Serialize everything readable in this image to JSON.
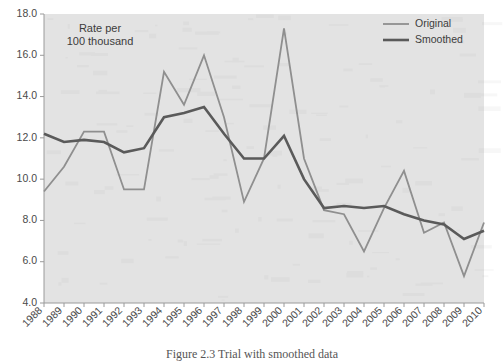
{
  "chart_data": {
    "type": "line",
    "title": "",
    "annotation": "Rate per\n100 thousand",
    "annotation_line1": "Rate per",
    "annotation_line2": "100 thousand",
    "xlabel": "",
    "ylabel": "",
    "ylim": [
      4.0,
      18.0
    ],
    "ytick_step": 2.0,
    "ytick_labels": [
      "18.0",
      "16.0",
      "14.0",
      "12.0",
      "10.0",
      "8.0",
      "6.0",
      "4.0"
    ],
    "ytick_values": [
      18.0,
      16.0,
      14.0,
      12.0,
      10.0,
      8.0,
      6.0,
      4.0
    ],
    "grid": false,
    "legend_position": "top-right",
    "categories": [
      "1988",
      "1989",
      "1990",
      "1991",
      "1992",
      "1993",
      "1994",
      "1995",
      "1996",
      "1997",
      "1998",
      "1999",
      "2000",
      "2001",
      "2002",
      "2003",
      "2004",
      "2005",
      "2006",
      "2007",
      "2008",
      "2009",
      "2010"
    ],
    "series": [
      {
        "name": "Original",
        "color": "#8f8f8f",
        "width": 1.8,
        "values": [
          9.4,
          10.6,
          12.3,
          12.3,
          9.5,
          9.5,
          15.2,
          13.6,
          16.0,
          13.0,
          8.9,
          11.0,
          17.3,
          11.0,
          8.5,
          8.3,
          6.5,
          8.6,
          10.4,
          7.4,
          7.9,
          5.3,
          7.9
        ]
      },
      {
        "name": "Smoothed",
        "color": "#5a5a5a",
        "width": 2.6,
        "values": [
          12.2,
          11.8,
          11.9,
          11.8,
          11.3,
          11.5,
          13.0,
          13.2,
          13.5,
          12.2,
          11.0,
          11.0,
          12.1,
          10.0,
          8.6,
          8.7,
          8.6,
          8.7,
          8.3,
          8.0,
          7.8,
          7.1,
          7.5
        ]
      }
    ],
    "legend": [
      {
        "label": "Original",
        "color": "#8f8f8f",
        "width": 1.8
      },
      {
        "label": "Smoothed",
        "color": "#5a5a5a",
        "width": 2.6
      }
    ]
  },
  "caption": {
    "text": "Figure 2.3  Trial with smoothed data"
  },
  "colors": {
    "plot_background": "#e3e3e3",
    "page_background": "#ffffff",
    "axis": "#9a9a9a",
    "original": "#8f8f8f",
    "smoothed": "#5a5a5a",
    "tick_text": "#4a4a4a"
  }
}
